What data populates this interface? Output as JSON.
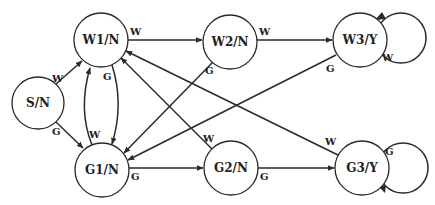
{
  "diagram": {
    "type": "state-machine",
    "colors": {
      "stroke": "#2a2a2a",
      "background": "#ffffff",
      "text": "#222222"
    },
    "nodes": [
      {
        "id": "S",
        "label": "S/N",
        "cx": 38,
        "cy": 103,
        "r": 26
      },
      {
        "id": "W1",
        "label": "W1/N",
        "cx": 101,
        "cy": 40,
        "r": 27
      },
      {
        "id": "G1",
        "label": "G1/N",
        "cx": 102,
        "cy": 170,
        "r": 27
      },
      {
        "id": "W2",
        "label": "W2/N",
        "cx": 230,
        "cy": 42,
        "r": 27
      },
      {
        "id": "G2",
        "label": "G2/N",
        "cx": 231,
        "cy": 168,
        "r": 27
      },
      {
        "id": "W3",
        "label": "W3/Y",
        "cx": 360,
        "cy": 40,
        "r": 27
      },
      {
        "id": "G3",
        "label": "G3/Y",
        "cx": 362,
        "cy": 168,
        "r": 27
      }
    ],
    "edges": [
      {
        "from": "S/N",
        "to": "W1/N",
        "label": "W"
      },
      {
        "from": "S/N",
        "to": "G1/N",
        "label": "G"
      },
      {
        "from": "W1/N",
        "to": "W2/N",
        "label": "W"
      },
      {
        "from": "W1/N",
        "to": "G1/N",
        "label": "G"
      },
      {
        "from": "G1/N",
        "to": "W1/N",
        "label": "W"
      },
      {
        "from": "W2/N",
        "to": "W3/Y",
        "label": "W"
      },
      {
        "from": "W2/N",
        "to": "G1/N",
        "label": "G"
      },
      {
        "from": "W3/Y",
        "to": "W3/Y",
        "label": "W"
      },
      {
        "from": "W3/Y",
        "to": "G1/N",
        "label": "G"
      },
      {
        "from": "G1/N",
        "to": "G2/N",
        "label": "G"
      },
      {
        "from": "G2/N",
        "to": "W1/N",
        "label": "W"
      },
      {
        "from": "G2/N",
        "to": "G3/Y",
        "label": "G"
      },
      {
        "from": "G3/Y",
        "to": "G3/Y",
        "label": "G"
      },
      {
        "from": "G3/Y",
        "to": "W1/N",
        "label": "W"
      }
    ]
  },
  "labels": {
    "s": "S/N",
    "w1": "W1/N",
    "g1": "G1/N",
    "w2": "W2/N",
    "g2": "G2/N",
    "w3": "W3/Y",
    "g3": "G3/Y",
    "e_s_w1": "W",
    "e_s_g1": "G",
    "e_w1_w2": "W",
    "e_w1_g1": "G",
    "e_g1_w1": "W",
    "e_w2_w3": "W",
    "e_w2_g1": "G",
    "e_w3_self": "W",
    "e_w3_g1": "G",
    "e_g1_g2": "G",
    "e_g2_w1": "W",
    "e_g2_g3": "G",
    "e_g3_self": "G",
    "e_g3_w1": "W"
  }
}
